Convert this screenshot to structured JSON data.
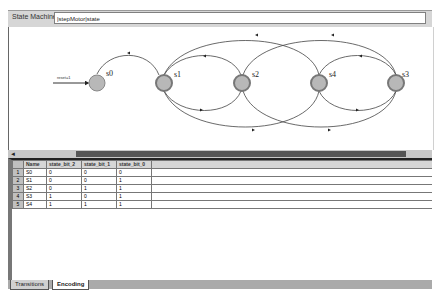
{
  "header": {
    "label": "State Machine:",
    "value": "|stepMotor|state"
  },
  "diagram": {
    "reset_label": "reset=1",
    "states": [
      {
        "name": "s0",
        "x": 88,
        "y": 56,
        "initial": true
      },
      {
        "name": "s1",
        "x": 161,
        "y": 56
      },
      {
        "name": "s2",
        "x": 234,
        "y": 56
      },
      {
        "name": "s4",
        "x": 310,
        "y": 56
      },
      {
        "name": "s3",
        "x": 387,
        "y": 56
      }
    ]
  },
  "scrollbar": {
    "left_arrow": "◄"
  },
  "table": {
    "headers": [
      "Name",
      "state_bit_2",
      "state_bit_1",
      "state_bit_0"
    ],
    "rows": [
      {
        "num": "1",
        "name": "S0",
        "b2": "0",
        "b1": "0",
        "b0": "0"
      },
      {
        "num": "2",
        "name": "S1",
        "b2": "0",
        "b1": "0",
        "b0": "1"
      },
      {
        "num": "3",
        "name": "S2",
        "b2": "0",
        "b1": "1",
        "b0": "1"
      },
      {
        "num": "4",
        "name": "S3",
        "b2": "1",
        "b1": "0",
        "b0": "1"
      },
      {
        "num": "5",
        "name": "S4",
        "b2": "1",
        "b1": "1",
        "b0": "1"
      }
    ]
  },
  "tabs": [
    {
      "label": "Transitions",
      "active": false
    },
    {
      "label": "Encoding",
      "active": true
    }
  ],
  "colors": {
    "state_fill": "#b8b8b8",
    "state_ring": "#888888",
    "scroll_thumb": "#555555"
  }
}
